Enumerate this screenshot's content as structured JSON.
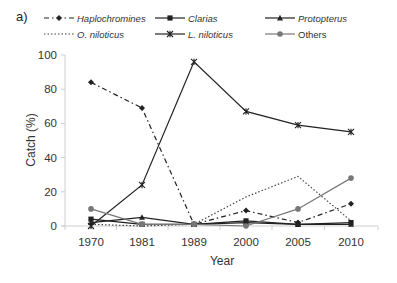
{
  "panel_label": "a)",
  "chart_data": {
    "type": "line",
    "title": "",
    "xlabel": "Year",
    "ylabel": "Catch (%)",
    "categories": [
      "1970",
      "1981",
      "1989",
      "2000",
      "2005",
      "2010"
    ],
    "ylim": [
      0,
      100
    ],
    "yticks": [
      0,
      20,
      40,
      60,
      80,
      100
    ],
    "grid": false,
    "legend_position": "top",
    "series": [
      {
        "name": "Haplochromines",
        "italic": true,
        "marker": "diamond",
        "line": "dashdot",
        "color": "#222222",
        "values": [
          84,
          69,
          1,
          9,
          2,
          13
        ]
      },
      {
        "name": "Clarias",
        "italic": true,
        "marker": "square",
        "line": "solid",
        "color": "#222222",
        "values": [
          4,
          1,
          1,
          3,
          1,
          2
        ]
      },
      {
        "name": "Protopterus",
        "italic": true,
        "marker": "triangle",
        "line": "solid",
        "color": "#222222",
        "values": [
          2,
          5,
          1,
          2,
          1,
          1
        ]
      },
      {
        "name": "O. niloticus",
        "italic": true,
        "marker": "none",
        "line": "dotted",
        "color": "#444444",
        "values": [
          1,
          0,
          1,
          17,
          29,
          3
        ]
      },
      {
        "name": "L. niloticus",
        "italic": true,
        "marker": "star",
        "line": "solid",
        "color": "#222222",
        "values": [
          0,
          24,
          96,
          67,
          59,
          55
        ]
      },
      {
        "name": "Others",
        "italic": false,
        "marker": "circle",
        "line": "solid",
        "color": "#777777",
        "values": [
          10,
          1,
          1,
          0,
          10,
          28
        ]
      }
    ]
  }
}
